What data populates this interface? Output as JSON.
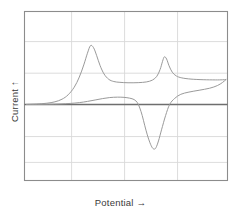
{
  "figure": {
    "type": "cyclic-voltammogram",
    "background": "#ffffff"
  },
  "axes": {
    "y_label": "Current",
    "y_arrow": "↑",
    "y_label_full": "Current ↑",
    "x_label": "Potential",
    "x_arrow": "→",
    "x_label_full": "Potential →"
  },
  "colors": {
    "frame": "#8c8c8c",
    "gridline": "#d9d9d9",
    "zero_baseline": "#6e6e6e",
    "curve": "#9a9a9a",
    "text": "#3a3a3a"
  },
  "chart_data": {
    "type": "line",
    "title": "",
    "xlabel": "Potential →",
    "ylabel": "Current ↑",
    "grid": true,
    "legend": false,
    "axis_tick_labels": [],
    "xlim": [
      0,
      1
    ],
    "ylim": [
      -1,
      1
    ],
    "gridlines": {
      "vertical_fractions": [
        0.232,
        0.493,
        0.754
      ],
      "horizontal_fractions": [
        0.178,
        0.365,
        0.55,
        0.74,
        0.893
      ],
      "zero_line_fraction": 0.55
    },
    "annotations": [
      {
        "name": "forward-anodic-peak",
        "x": 0.325,
        "y": 0.58
      },
      {
        "name": "reverse-anodic-peak",
        "x": 0.689,
        "y": 0.47
      },
      {
        "name": "reverse-cathodic-peak",
        "x": 0.64,
        "y": -0.44
      },
      {
        "name": "forward-shoulder-plateau",
        "x": 0.56,
        "y": 0.215
      },
      {
        "name": "right-turnaround-spike",
        "x": 0.985,
        "y": 0.245
      }
    ],
    "series": [
      {
        "name": "forward-scan",
        "description": "anodic forward sweep: baseline rise to sharp peak, decay to plateau, second sharp peak near switching potential, spike to turnaround",
        "points": [
          [
            0.01,
            0.0
          ],
          [
            0.06,
            0.004
          ],
          [
            0.11,
            0.012
          ],
          [
            0.15,
            0.026
          ],
          [
            0.185,
            0.052
          ],
          [
            0.215,
            0.095
          ],
          [
            0.245,
            0.17
          ],
          [
            0.27,
            0.27
          ],
          [
            0.292,
            0.39
          ],
          [
            0.31,
            0.505
          ],
          [
            0.325,
            0.58
          ],
          [
            0.34,
            0.56
          ],
          [
            0.355,
            0.485
          ],
          [
            0.372,
            0.385
          ],
          [
            0.392,
            0.3
          ],
          [
            0.415,
            0.248
          ],
          [
            0.44,
            0.226
          ],
          [
            0.47,
            0.218
          ],
          [
            0.51,
            0.214
          ],
          [
            0.56,
            0.215
          ],
          [
            0.6,
            0.222
          ],
          [
            0.63,
            0.24
          ],
          [
            0.652,
            0.278
          ],
          [
            0.668,
            0.345
          ],
          [
            0.68,
            0.425
          ],
          [
            0.689,
            0.47
          ],
          [
            0.7,
            0.448
          ],
          [
            0.712,
            0.382
          ],
          [
            0.728,
            0.318
          ],
          [
            0.748,
            0.281
          ],
          [
            0.775,
            0.262
          ],
          [
            0.82,
            0.25
          ],
          [
            0.88,
            0.244
          ],
          [
            0.94,
            0.242
          ],
          [
            0.975,
            0.243
          ],
          [
            0.992,
            0.245
          ]
        ]
      },
      {
        "name": "reverse-scan",
        "description": "cathodic return sweep: from turnaround down through zero to sharp negative peak, then broad low positive hump back to baseline",
        "points": [
          [
            0.992,
            0.245
          ],
          [
            0.975,
            0.216
          ],
          [
            0.95,
            0.186
          ],
          [
            0.912,
            0.16
          ],
          [
            0.86,
            0.14
          ],
          [
            0.81,
            0.122
          ],
          [
            0.77,
            0.1
          ],
          [
            0.74,
            0.06
          ],
          [
            0.715,
            0.0
          ],
          [
            0.695,
            -0.11
          ],
          [
            0.675,
            -0.25
          ],
          [
            0.66,
            -0.36
          ],
          [
            0.648,
            -0.425
          ],
          [
            0.64,
            -0.44
          ],
          [
            0.63,
            -0.428
          ],
          [
            0.618,
            -0.378
          ],
          [
            0.605,
            -0.3
          ],
          [
            0.592,
            -0.205
          ],
          [
            0.58,
            -0.11
          ],
          [
            0.568,
            -0.035
          ],
          [
            0.556,
            0.018
          ],
          [
            0.54,
            0.048
          ],
          [
            0.518,
            0.062
          ],
          [
            0.49,
            0.07
          ],
          [
            0.458,
            0.072
          ],
          [
            0.42,
            0.068
          ],
          [
            0.385,
            0.058
          ],
          [
            0.348,
            0.044
          ],
          [
            0.31,
            0.03
          ],
          [
            0.27,
            0.018
          ],
          [
            0.225,
            0.01
          ],
          [
            0.175,
            0.005
          ],
          [
            0.12,
            0.002
          ],
          [
            0.065,
            0.001
          ],
          [
            0.01,
            0.0
          ]
        ]
      }
    ]
  }
}
